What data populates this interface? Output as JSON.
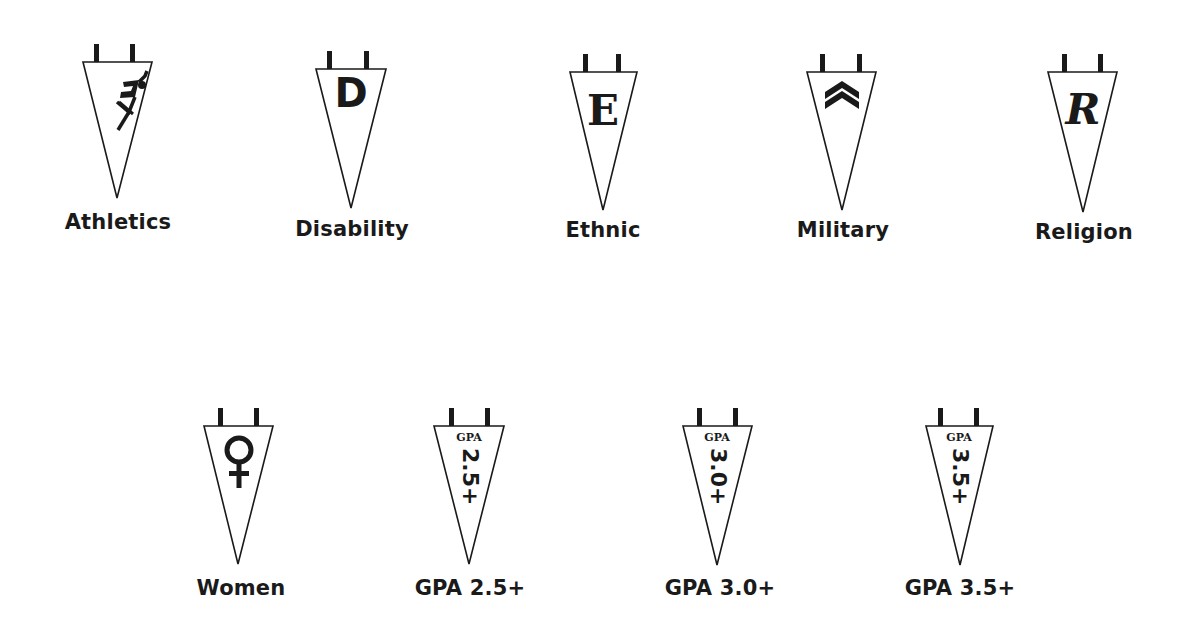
{
  "pennants": [
    {
      "id": "athletics",
      "label": "Athletics",
      "icon": "runner-icon",
      "x": 37,
      "y": 42,
      "label_y": 168
    },
    {
      "id": "disability",
      "label": "Disability",
      "icon": "letter-d-icon",
      "glyph": "D",
      "x": 271,
      "y": 49,
      "label_y": 168
    },
    {
      "id": "ethnic",
      "label": "Ethnic",
      "icon": "letter-e-icon",
      "glyph": "E",
      "x": 523,
      "y": 52,
      "label_y": 166
    },
    {
      "id": "military",
      "label": "Military",
      "icon": "chevron-rank-icon",
      "x": 762,
      "y": 52,
      "label_y": 166
    },
    {
      "id": "religion",
      "label": "Religion",
      "icon": "letter-r-icon",
      "glyph": "R",
      "x": 1003,
      "y": 52,
      "label_y": 168
    },
    {
      "id": "women",
      "label": "Women",
      "icon": "female-symbol-icon",
      "glyph": "♀",
      "x": 158,
      "y": 406,
      "label_y": 170
    },
    {
      "id": "gpa-2-5",
      "label": "GPA 2.5+",
      "icon": "gpa-icon",
      "gpa_small": "GPA",
      "gpa_value": "2.5+",
      "x": 389,
      "y": 406,
      "label_y": 170
    },
    {
      "id": "gpa-3-0",
      "label": "GPA 3.0+",
      "icon": "gpa-icon",
      "gpa_small": "GPA",
      "gpa_value": "3.0+",
      "x": 638,
      "y": 406,
      "label_y": 170
    },
    {
      "id": "gpa-3-5",
      "label": "GPA 3.5+",
      "icon": "gpa-icon",
      "gpa_small": "GPA",
      "gpa_value": "3.5+",
      "x": 880,
      "y": 406,
      "label_y": 170
    }
  ],
  "colors": {
    "ink": "#1a1a1a",
    "background": "#ffffff"
  }
}
